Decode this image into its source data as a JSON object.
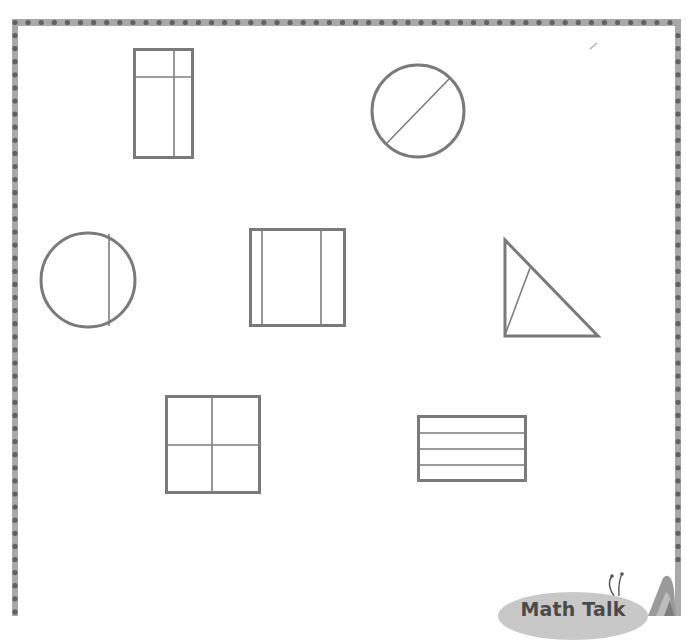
{
  "activity": {
    "description": "Shapes divided into parts for identifying equal and unequal shares",
    "shapes": [
      {
        "id": "rectangle-uneven-grid",
        "kind": "rectangle",
        "parts": 4,
        "equal_parts": false
      },
      {
        "id": "circle-diagonal-split",
        "kind": "circle",
        "parts": 2,
        "equal_parts": true
      },
      {
        "id": "circle-offset-split",
        "kind": "circle",
        "parts": 2,
        "equal_parts": false
      },
      {
        "id": "square-three-strips",
        "kind": "square",
        "parts": 3,
        "equal_parts": false
      },
      {
        "id": "triangle-split",
        "kind": "triangle",
        "parts": 2,
        "equal_parts": false
      },
      {
        "id": "square-quarters",
        "kind": "square",
        "parts": 4,
        "equal_parts": true
      },
      {
        "id": "rectangle-four-strips",
        "kind": "rectangle",
        "parts": 4,
        "equal_parts": true
      }
    ]
  },
  "badge": {
    "label": "Math Talk",
    "icon": "butterfly-icon"
  },
  "colors": {
    "shape_stroke": "#7a7a7a",
    "border_strip": "#a9a9a9",
    "border_dot": "#626262",
    "badge_fill": "#c8c8c8",
    "badge_text": "#4a4a4a"
  }
}
